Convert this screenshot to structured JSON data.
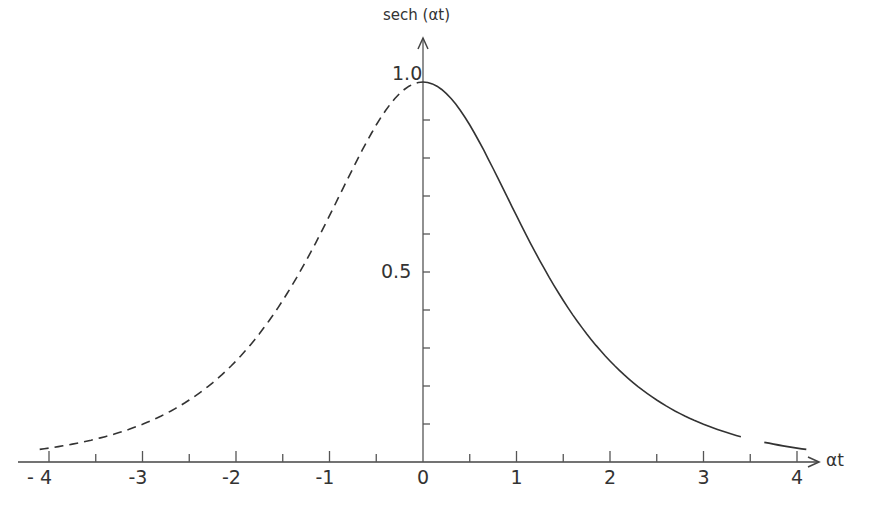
{
  "chart_data": {
    "type": "line",
    "title": "",
    "xlabel": "αt",
    "ylabel": "sech (αt)",
    "xlim": [
      -4.2,
      4.3
    ],
    "ylim": [
      0,
      1.0
    ],
    "x_ticks": [
      "-4",
      "-3",
      "-2",
      "-1",
      "0",
      "1",
      "2",
      "3",
      "4"
    ],
    "y_tick_labels": [
      "0.5",
      "1.0"
    ],
    "y_minor_step": 0.1,
    "x_minor_step": 0.5,
    "grid": false,
    "series": [
      {
        "name": "sech(αt), αt<0",
        "style": "dashed",
        "x": [
          -4,
          -3.5,
          -3,
          -2.5,
          -2,
          -1.5,
          -1,
          -0.5,
          0
        ],
        "y": [
          0.037,
          0.06,
          0.099,
          0.163,
          0.266,
          0.425,
          0.648,
          0.887,
          1.0
        ]
      },
      {
        "name": "sech(αt), αt>=0",
        "style": "solid",
        "x": [
          0,
          0.5,
          1,
          1.5,
          2,
          2.5,
          3,
          3.5,
          4
        ],
        "y": [
          1.0,
          0.887,
          0.648,
          0.425,
          0.266,
          0.163,
          0.099,
          0.06,
          0.037
        ]
      }
    ]
  },
  "axes": {
    "y_title": "sech (αt)",
    "x_title": "αt",
    "y_label_top": "1.0",
    "y_label_mid": "0.5",
    "x_labels": [
      "- 4",
      "-3",
      "-2",
      "-1",
      "0",
      "1",
      "2",
      "3",
      "4"
    ]
  }
}
